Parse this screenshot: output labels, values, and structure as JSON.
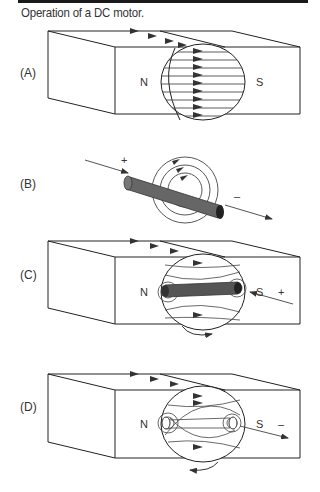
{
  "figure": {
    "caption": "Operation of a DC motor.",
    "panels": [
      {
        "label": "(A)",
        "north": "N",
        "south": "S"
      },
      {
        "label": "(B)",
        "plus": "+",
        "minus": "–"
      },
      {
        "label": "(C)",
        "north": "N",
        "south": "S",
        "sign": "+"
      },
      {
        "label": "(D)",
        "north": "N",
        "south": "S",
        "sign": "–"
      }
    ]
  }
}
